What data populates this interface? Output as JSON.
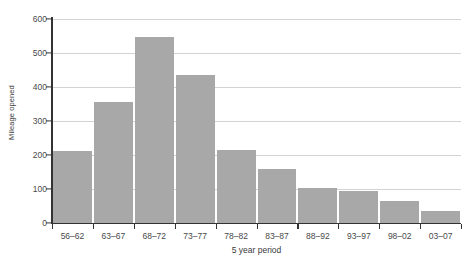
{
  "chart_data": {
    "type": "bar",
    "title": "",
    "xlabel": "5 year period",
    "ylabel": "Mileage opened",
    "categories": [
      "56–62",
      "63–67",
      "68–72",
      "73–77",
      "78–82",
      "83–87",
      "88–92",
      "93–97",
      "98–02",
      "03–07"
    ],
    "values": [
      213,
      356,
      548,
      436,
      215,
      160,
      104,
      95,
      65,
      35
    ],
    "ylim": [
      0,
      600
    ],
    "yticks": [
      0,
      100,
      200,
      300,
      400,
      500,
      600
    ],
    "ytick_labels": [
      "0",
      "100",
      "200",
      "300",
      "400",
      "500",
      "600"
    ],
    "grid": "horizontal",
    "legend": "none",
    "bar_color": "#a8a8a8",
    "grid_color": "#d3d3d3",
    "axis_color": "#333333"
  }
}
